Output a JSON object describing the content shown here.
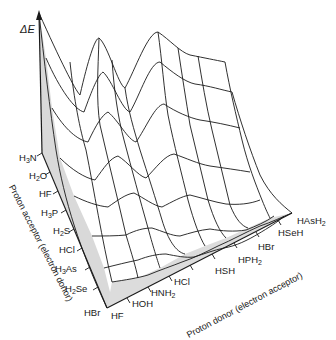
{
  "figure": {
    "type": "3d-wireframe-surface",
    "vertical_axis": {
      "label": "ΔE"
    },
    "left_axis": {
      "title": "Proton acceptor (electron donor)",
      "ticks": [
        "H3N",
        "H2O",
        "HF",
        "H3P",
        "H2S",
        "HCl",
        "H3As",
        "H2Se",
        "HBr"
      ]
    },
    "right_axis": {
      "title": "Proton donor (electron acceptor)",
      "ticks": [
        "HF",
        "HOH",
        "HNH2",
        "HCl",
        "HSH",
        "HPH2",
        "HBr",
        "HSeH",
        "HAsH2"
      ]
    },
    "features": {
      "peaks": 2,
      "shaded_side_faces": true,
      "shade_color": "#d9d9d9",
      "line_color": "#1a1a1a"
    }
  },
  "labels": {
    "de": "ΔE",
    "acc_title": "Proton acceptor (electron donor)",
    "don_title": "Proton donor (electron acceptor)",
    "acc": {
      "h3n": [
        "H",
        "3",
        "N"
      ],
      "h2o": [
        "H",
        "2",
        "O"
      ],
      "hf": "HF",
      "h3p": [
        "H",
        "3",
        "P"
      ],
      "h2s": [
        "H",
        "2",
        "S"
      ],
      "hcl": "HCl",
      "h3as": [
        "H",
        "3",
        "As"
      ],
      "h2se": [
        "H",
        "2",
        "Se"
      ],
      "hbr": "HBr"
    },
    "don": {
      "hf": "HF",
      "hoh": "HOH",
      "hnh2": [
        "HNH",
        "2"
      ],
      "hcl": "HCl",
      "hsh": "HSH",
      "hph2": [
        "HPH",
        "2"
      ],
      "hbr": "HBr",
      "hseh": "HSeH",
      "hash2": [
        "HAsH",
        "2"
      ]
    }
  }
}
